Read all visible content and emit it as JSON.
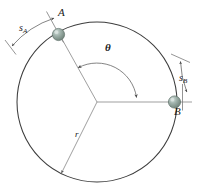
{
  "figure": {
    "type": "geometry-diagram",
    "width": 206,
    "height": 189,
    "background_color": "#ffffff",
    "line_color": "#3a3a3a",
    "thin_line_color": "#8a8a8a",
    "sphere_fill": "#93a9a1",
    "sphere_edge": "#5d7068",
    "sphere_highlight": "#c9d6d0"
  },
  "labels": {
    "point_a": "A",
    "point_b": "B",
    "angle": "θ",
    "radius": "r",
    "arc_a_letter": "s",
    "arc_a_sub": "A",
    "arc_b_letter": "s",
    "arc_b_sub": "B"
  },
  "geometry": {
    "circle": {
      "cx": 97,
      "cy": 102,
      "r": 80
    },
    "center_point": {
      "x": 97,
      "y": 102
    },
    "point_a": {
      "x": 58,
      "y": 34
    },
    "point_b": {
      "x": 175,
      "y": 102
    },
    "point_bottom_radius_end": {
      "x": 60,
      "y": 174
    },
    "angle_degrees": 120
  },
  "annotations": {
    "arc_a_description": "arc length s_A measured outside the circle at point A",
    "arc_b_description": "arc length s_B measured outside the circle at point B",
    "theta_description": "central angle theta between radius to A and radius to B",
    "r_description": "radius r of the circle"
  }
}
